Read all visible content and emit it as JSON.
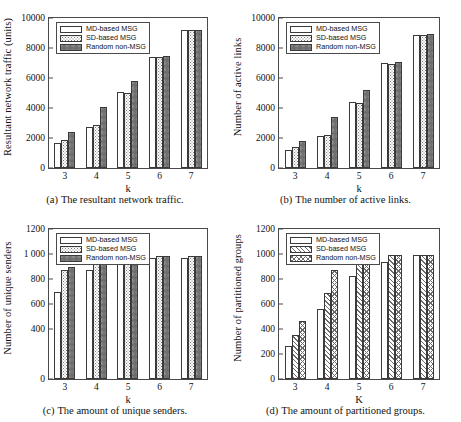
{
  "figure": {
    "series_names": [
      "MD-based MSG",
      "SD-based MSG",
      "Random non-MSG"
    ]
  },
  "panels": [
    {
      "id": "a",
      "caption_tag": "(a)",
      "caption_text": "The resultant network traffic.",
      "legend": [
        "MD-based MSG",
        "SD-based MSG",
        "Random non-MSG"
      ],
      "chart_data": {
        "type": "bar",
        "title": "",
        "xlabel": "k",
        "ylabel": "Resultant network traffic (units)",
        "categories": [
          "3",
          "4",
          "5",
          "6",
          "7"
        ],
        "yticks": [
          "0",
          "2000",
          "4000",
          "6000",
          "8000",
          "10000"
        ],
        "ylim": [
          0,
          10000
        ],
        "grid": false,
        "legend_position": "top-left",
        "series": [
          {
            "name": "MD-based MSG",
            "values": [
              1650,
              2720,
              5080,
              7400,
              9220
            ]
          },
          {
            "name": "SD-based MSG",
            "values": [
              1900,
              2850,
              5000,
              7400,
              9200
            ]
          },
          {
            "name": "Random non-MSG",
            "values": [
              2420,
              4060,
              5820,
              7470,
              9200
            ]
          }
        ]
      }
    },
    {
      "id": "b",
      "caption_tag": "(b)",
      "caption_text": "The number of active links.",
      "legend": [
        "MD-based MSG",
        "SD-based MSG",
        "Random non-MSG"
      ],
      "chart_data": {
        "type": "bar",
        "title": "",
        "xlabel": "k",
        "ylabel": "Number of active links",
        "categories": [
          "3",
          "4",
          "5",
          "6",
          "7"
        ],
        "yticks": [
          "0",
          "2000",
          "4000",
          "6000",
          "8000",
          "10000"
        ],
        "ylim": [
          0,
          10000
        ],
        "grid": false,
        "legend_position": "top-left",
        "series": [
          {
            "name": "MD-based MSG",
            "values": [
              1180,
              2120,
              4400,
              6980,
              8900
            ]
          },
          {
            "name": "SD-based MSG",
            "values": [
              1380,
              2180,
              4330,
              6950,
              8900
            ]
          },
          {
            "name": "Random non-MSG",
            "values": [
              1770,
              3420,
              5230,
              7040,
              8920
            ]
          }
        ]
      }
    },
    {
      "id": "c",
      "caption_tag": "(c)",
      "caption_text": "The amount of unique senders.",
      "legend": [
        "MD-based MSG",
        "SD-based MSG",
        "Random non-MSG"
      ],
      "chart_data": {
        "type": "bar",
        "title": "",
        "xlabel": "k",
        "ylabel": "Number of unique senders",
        "categories": [
          "3",
          "4",
          "5",
          "6",
          "7"
        ],
        "yticks": [
          "0",
          "400",
          "600",
          "800",
          "1 000",
          "1200"
        ],
        "ytick_values": [
          0,
          400,
          600,
          800,
          1000,
          1200
        ],
        "ylim": [
          0,
          1200
        ],
        "grid": false,
        "legend_position": "top-left",
        "series": [
          {
            "name": "MD-based MSG",
            "values": [
              695,
              872,
              975,
              972,
              972
            ]
          },
          {
            "name": "SD-based MSG",
            "values": [
              872,
              940,
              985,
              985,
              985
            ]
          },
          {
            "name": "Random non-MSG",
            "values": [
              900,
              972,
              990,
              988,
              988
            ]
          }
        ]
      }
    },
    {
      "id": "d",
      "caption_tag": "(d)",
      "caption_text": "The amount of partitioned groups.",
      "legend": [
        "MD-based MSG",
        "SD-based MSG",
        "Random non-MSG"
      ],
      "chart_data": {
        "type": "bar",
        "title": "",
        "xlabel": "K",
        "ylabel": "Number of partitioned groups",
        "categories": [
          "3",
          "4",
          "5",
          "6",
          "7"
        ],
        "yticks": [
          "0",
          "200",
          "400",
          "600",
          "800",
          "1000",
          "1200"
        ],
        "ylim": [
          0,
          1200
        ],
        "grid": false,
        "legend_position": "top-left",
        "series": [
          {
            "name": "MD-based MSG",
            "values": [
              262,
              562,
              822,
              935,
              990
            ]
          },
          {
            "name": "SD-based MSG",
            "values": [
              352,
              688,
              952,
              990,
              990
            ]
          },
          {
            "name": "Random non-MSG",
            "values": [
              462,
              872,
              975,
              992,
              992
            ]
          }
        ]
      }
    }
  ]
}
